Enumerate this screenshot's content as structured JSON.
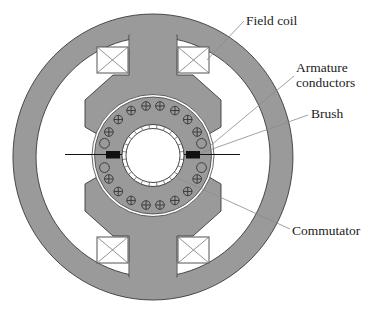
{
  "figure": {
    "labels": {
      "field_coil": "Field coil",
      "armature_line1": "Armature",
      "armature_line2": "conductors",
      "brush": "Brush",
      "commutator": "Commutator"
    },
    "colors": {
      "iron": "#9a9a9a",
      "outline": "#3a3a3a",
      "brush": "#111111",
      "background": "#ffffff"
    },
    "field_coils": [
      {
        "id": "top-left"
      },
      {
        "id": "top-right"
      },
      {
        "id": "bottom-left"
      },
      {
        "id": "bottom-right"
      }
    ],
    "armature_conductors": {
      "crossed_count": 16,
      "plain_count": 4
    },
    "brushes": [
      {
        "id": "left"
      },
      {
        "id": "right"
      }
    ],
    "commutator_segments": 24
  }
}
